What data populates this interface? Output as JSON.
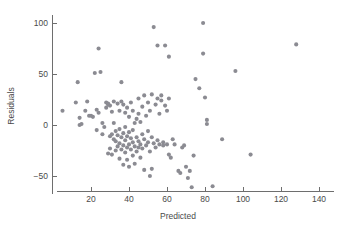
{
  "chart_data": {
    "type": "scatter",
    "title": "",
    "xlabel": "Predicted",
    "ylabel": "Residuals",
    "xlim": [
      2,
      148
    ],
    "ylim": [
      -68,
      108
    ],
    "xticks": [
      20,
      40,
      60,
      80,
      100,
      120,
      140
    ],
    "xtick_labels": [
      "20",
      "40",
      "60",
      "80",
      "100",
      "120",
      "140"
    ],
    "yticks": [
      -50,
      0,
      50,
      100
    ],
    "ytick_labels": [
      "−50",
      "0",
      "50",
      "100"
    ],
    "grid": false,
    "legend": null,
    "marker": {
      "shape": "circle",
      "color": "#8b8b92",
      "size_px": 3.4
    },
    "axis_color": "#6e6e6e",
    "text_color": "#4a4a4a",
    "background": "#ffffff",
    "n_points": 132,
    "points": [
      [
        5,
        14
      ],
      [
        12,
        22
      ],
      [
        13,
        42
      ],
      [
        14,
        7
      ],
      [
        14,
        0
      ],
      [
        15,
        1
      ],
      [
        17,
        14
      ],
      [
        18,
        23
      ],
      [
        19,
        9
      ],
      [
        20,
        9
      ],
      [
        21,
        8
      ],
      [
        22,
        51
      ],
      [
        23,
        -5
      ],
      [
        23,
        15
      ],
      [
        24,
        75
      ],
      [
        24,
        12
      ],
      [
        25,
        52
      ],
      [
        26,
        2
      ],
      [
        26,
        -9
      ],
      [
        27,
        -2
      ],
      [
        28,
        17
      ],
      [
        28,
        22
      ],
      [
        29,
        21
      ],
      [
        29,
        20
      ],
      [
        29,
        -28
      ],
      [
        30,
        19
      ],
      [
        30,
        -11
      ],
      [
        30,
        -23
      ],
      [
        31,
        13
      ],
      [
        31,
        -9
      ],
      [
        31,
        -29
      ],
      [
        32,
        23
      ],
      [
        32,
        2
      ],
      [
        32,
        -14
      ],
      [
        33,
        -6
      ],
      [
        33,
        -16
      ],
      [
        33,
        -25
      ],
      [
        34,
        21
      ],
      [
        34,
        -10
      ],
      [
        34,
        -21
      ],
      [
        35,
        14
      ],
      [
        35,
        -4
      ],
      [
        35,
        -18
      ],
      [
        35,
        -33
      ],
      [
        36,
        42
      ],
      [
        36,
        23
      ],
      [
        36,
        -12
      ],
      [
        36,
        -24
      ],
      [
        37,
        20
      ],
      [
        37,
        -8
      ],
      [
        37,
        -20
      ],
      [
        37,
        -39
      ],
      [
        38,
        12
      ],
      [
        38,
        -2
      ],
      [
        38,
        -15
      ],
      [
        38,
        -27
      ],
      [
        39,
        17
      ],
      [
        39,
        -11
      ],
      [
        39,
        -22
      ],
      [
        39,
        -34
      ],
      [
        40,
        8
      ],
      [
        40,
        -7
      ],
      [
        40,
        -19
      ],
      [
        40,
        -41
      ],
      [
        41,
        22
      ],
      [
        41,
        -13
      ],
      [
        41,
        -24
      ],
      [
        42,
        14
      ],
      [
        42,
        -5
      ],
      [
        42,
        -17
      ],
      [
        42,
        -30
      ],
      [
        43,
        2
      ],
      [
        43,
        -21
      ],
      [
        43,
        -38
      ],
      [
        44,
        6
      ],
      [
        44,
        -12
      ],
      [
        44,
        -26
      ],
      [
        45,
        26
      ],
      [
        45,
        11
      ],
      [
        45,
        -16
      ],
      [
        45,
        -22
      ],
      [
        46,
        3
      ],
      [
        46,
        -19
      ],
      [
        46,
        -32
      ],
      [
        47,
        18
      ],
      [
        47,
        -9
      ],
      [
        47,
        -23
      ],
      [
        48,
        29
      ],
      [
        48,
        -14
      ],
      [
        48,
        -44
      ],
      [
        49,
        9
      ],
      [
        49,
        -20
      ],
      [
        50,
        22
      ],
      [
        50,
        -6
      ],
      [
        50,
        -17
      ],
      [
        51,
        14
      ],
      [
        51,
        -26
      ],
      [
        51,
        -50
      ],
      [
        52,
        30
      ],
      [
        52,
        -12
      ],
      [
        52,
        -43
      ],
      [
        53,
        96
      ],
      [
        53,
        -18
      ],
      [
        54,
        20
      ],
      [
        54,
        -22
      ],
      [
        55,
        78
      ],
      [
        55,
        26
      ],
      [
        55,
        -15
      ],
      [
        56,
        11
      ],
      [
        56,
        -19
      ],
      [
        57,
        24
      ],
      [
        57,
        29
      ],
      [
        58,
        -20
      ],
      [
        58,
        -17
      ],
      [
        59,
        78
      ],
      [
        59,
        19
      ],
      [
        60,
        14
      ],
      [
        60,
        -19
      ],
      [
        61,
        67
      ],
      [
        61,
        26
      ],
      [
        61,
        -29
      ],
      [
        62,
        -32
      ],
      [
        63,
        -14
      ],
      [
        64,
        -19
      ],
      [
        66,
        -45
      ],
      [
        67,
        -47
      ],
      [
        68,
        -22
      ],
      [
        69,
        -20
      ],
      [
        70,
        -41
      ],
      [
        71,
        -52
      ],
      [
        72,
        -45
      ],
      [
        73,
        -61
      ],
      [
        74,
        -30
      ],
      [
        75,
        45
      ],
      [
        77,
        36
      ],
      [
        79,
        100
      ],
      [
        79,
        70
      ],
      [
        80,
        27
      ],
      [
        81,
        5
      ],
      [
        81,
        1
      ],
      [
        84,
        -60
      ],
      [
        89,
        -14
      ],
      [
        96,
        53
      ],
      [
        104,
        -29
      ],
      [
        128,
        79
      ]
    ]
  }
}
